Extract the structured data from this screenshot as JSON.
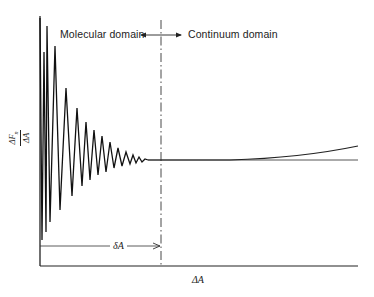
{
  "figure": {
    "labels": {
      "molecular_domain": "Molecular domain",
      "continuum_domain": "Continuum domain",
      "y_axis_numerator": "ΔF",
      "y_axis_subscript": "n",
      "y_axis_denominator": "ΔA",
      "x_axis": "ΔA",
      "delta_a": "δA"
    },
    "colors": {
      "ink": "#222222",
      "background": "#ffffff"
    },
    "geometry": {
      "y_axis_x": 40,
      "x_axis_y": 266,
      "boundary_x": 161,
      "reference_level_y": 160
    },
    "oscillation_vertices": [
      [
        40,
        18
      ],
      [
        42,
        240
      ],
      [
        44,
        52
      ],
      [
        46,
        232
      ],
      [
        47,
        26
      ],
      [
        50,
        222
      ],
      [
        55,
        46
      ],
      [
        60,
        210
      ],
      [
        66,
        88
      ],
      [
        72,
        196
      ],
      [
        77,
        108
      ],
      [
        82,
        186
      ],
      [
        86,
        122
      ],
      [
        90,
        180
      ],
      [
        94,
        130
      ],
      [
        98,
        175
      ],
      [
        102,
        136
      ],
      [
        106,
        172
      ],
      [
        110,
        142
      ],
      [
        114,
        168
      ],
      [
        118,
        148
      ],
      [
        122,
        166
      ],
      [
        126,
        152
      ],
      [
        130,
        164
      ],
      [
        133,
        155
      ],
      [
        136,
        163
      ],
      [
        139,
        157
      ],
      [
        142,
        162
      ],
      [
        145,
        159
      ],
      [
        148,
        160
      ]
    ]
  }
}
